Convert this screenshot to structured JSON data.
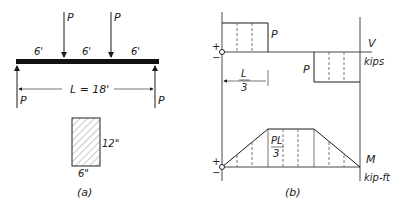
{
  "part_a": {
    "caption": "(a)",
    "load_label_1": "P",
    "load_label_2": "P",
    "span_1": "6'",
    "span_2": "6'",
    "span_3": "6'",
    "length_label": "L = 18'",
    "reaction_left": "P",
    "reaction_right": "P",
    "section_height": "12\"",
    "section_width": "6\""
  },
  "part_b": {
    "caption": "(b)",
    "shear": {
      "plus": "+",
      "minus": "−",
      "left_value": "P",
      "right_value": "P",
      "axis_label": "V",
      "units": "kips",
      "dim_num": "L",
      "dim_den": "3"
    },
    "moment": {
      "plus": "+",
      "minus": "−",
      "peak_num": "PL",
      "peak_den": "3",
      "axis_label": "M",
      "units": "kip-ft"
    }
  }
}
